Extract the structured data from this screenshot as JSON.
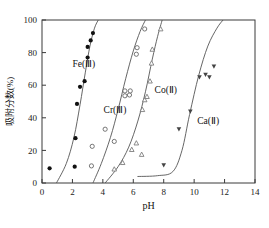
{
  "chart_data": {
    "type": "scatter",
    "title": "",
    "xlabel": "pH",
    "ylabel": "吸附分数(%)",
    "xlim": [
      0,
      14
    ],
    "ylim": [
      0,
      100
    ],
    "xticks": [
      0,
      2,
      4,
      6,
      8,
      10,
      12,
      14
    ],
    "yticks": [
      0,
      20,
      40,
      60,
      80,
      100
    ],
    "grid": false,
    "legend_position": "inline-annotations",
    "series": [
      {
        "name": "Fe(Ⅲ)",
        "marker": "filled-circle",
        "color": "#111111",
        "label_x": 2.0,
        "label_y": 71,
        "points": [
          {
            "x": 0.5,
            "y": 9
          },
          {
            "x": 2.15,
            "y": 10
          },
          {
            "x": 2.2,
            "y": 27.5
          },
          {
            "x": 2.3,
            "y": 48.5
          },
          {
            "x": 2.5,
            "y": 59
          },
          {
            "x": 2.8,
            "y": 62.5
          },
          {
            "x": 3.0,
            "y": 77
          },
          {
            "x": 3.0,
            "y": 83.5
          },
          {
            "x": 3.2,
            "y": 87.5
          },
          {
            "x": 3.35,
            "y": 92
          }
        ],
        "curve": [
          {
            "x": 0.95,
            "y": 0
          },
          {
            "x": 1.6,
            "y": 12
          },
          {
            "x": 2.1,
            "y": 28
          },
          {
            "x": 2.5,
            "y": 48
          },
          {
            "x": 2.85,
            "y": 68
          },
          {
            "x": 3.15,
            "y": 84
          },
          {
            "x": 3.45,
            "y": 95
          },
          {
            "x": 3.7,
            "y": 100
          }
        ]
      },
      {
        "name": "Cr(Ⅲ)",
        "marker": "open-circle",
        "color": "#666666",
        "label_x": 4.05,
        "label_y": 43,
        "points": [
          {
            "x": 3.25,
            "y": 10.5
          },
          {
            "x": 3.3,
            "y": 22.5
          },
          {
            "x": 4.15,
            "y": 33
          },
          {
            "x": 4.75,
            "y": 25.5
          },
          {
            "x": 5.45,
            "y": 53.5
          },
          {
            "x": 5.45,
            "y": 56.5
          },
          {
            "x": 5.75,
            "y": 54
          },
          {
            "x": 5.8,
            "y": 56.5
          },
          {
            "x": 6.2,
            "y": 79
          },
          {
            "x": 6.25,
            "y": 83
          },
          {
            "x": 6.75,
            "y": 94.5
          }
        ],
        "curve": [
          {
            "x": 3.35,
            "y": 0
          },
          {
            "x": 3.9,
            "y": 12
          },
          {
            "x": 4.5,
            "y": 28
          },
          {
            "x": 5.0,
            "y": 45
          },
          {
            "x": 5.5,
            "y": 64
          },
          {
            "x": 6.0,
            "y": 81
          },
          {
            "x": 6.45,
            "y": 93
          },
          {
            "x": 6.8,
            "y": 100
          }
        ]
      },
      {
        "name": "Co(Ⅱ)",
        "marker": "open-triangle",
        "color": "#777777",
        "label_x": 7.4,
        "label_y": 55,
        "points": [
          {
            "x": 4.75,
            "y": 8.5
          },
          {
            "x": 5.3,
            "y": 12.5
          },
          {
            "x": 5.9,
            "y": 20.5
          },
          {
            "x": 6.2,
            "y": 24.5
          },
          {
            "x": 6.55,
            "y": 17.5
          },
          {
            "x": 6.6,
            "y": 45
          },
          {
            "x": 6.75,
            "y": 51
          },
          {
            "x": 6.9,
            "y": 53
          },
          {
            "x": 7.1,
            "y": 62.5
          },
          {
            "x": 7.2,
            "y": 73.5
          },
          {
            "x": 7.25,
            "y": 82
          },
          {
            "x": 7.8,
            "y": 94.5
          }
        ],
        "curve": [
          {
            "x": 4.15,
            "y": 0
          },
          {
            "x": 5.0,
            "y": 10
          },
          {
            "x": 5.7,
            "y": 22
          },
          {
            "x": 6.3,
            "y": 38
          },
          {
            "x": 6.8,
            "y": 56
          },
          {
            "x": 7.25,
            "y": 76
          },
          {
            "x": 7.6,
            "y": 90
          },
          {
            "x": 7.9,
            "y": 100
          }
        ]
      },
      {
        "name": "Ca(Ⅱ)",
        "marker": "filled-down-triangle",
        "color": "#444444",
        "label_x": 10.2,
        "label_y": 36,
        "points": [
          {
            "x": 8.0,
            "y": 11
          },
          {
            "x": 9.0,
            "y": 33
          },
          {
            "x": 9.75,
            "y": 44
          },
          {
            "x": 10.35,
            "y": 65
          },
          {
            "x": 10.75,
            "y": 66.5
          },
          {
            "x": 11.0,
            "y": 65
          },
          {
            "x": 11.3,
            "y": 71.5
          }
        ],
        "curve": [
          {
            "x": 6.3,
            "y": 4
          },
          {
            "x": 7.6,
            "y": 4.5
          },
          {
            "x": 8.6,
            "y": 7
          },
          {
            "x": 9.2,
            "y": 20
          },
          {
            "x": 9.7,
            "y": 42
          },
          {
            "x": 10.3,
            "y": 66
          },
          {
            "x": 10.9,
            "y": 84
          },
          {
            "x": 11.5,
            "y": 95
          },
          {
            "x": 11.9,
            "y": 100
          }
        ]
      }
    ]
  }
}
